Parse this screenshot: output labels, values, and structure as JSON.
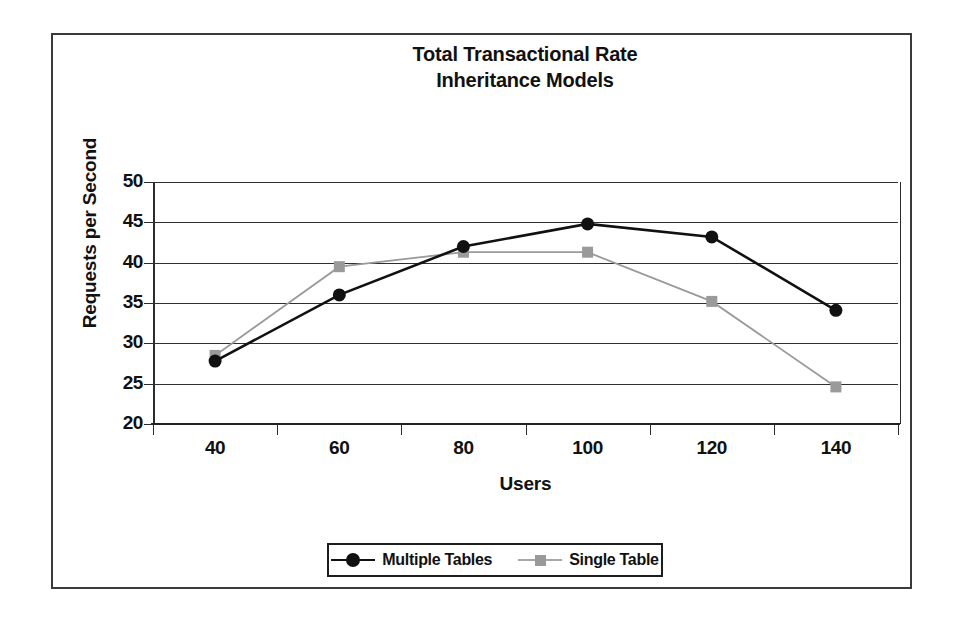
{
  "chart_data": {
    "type": "line",
    "title": "Total Transactional Rate\nInheritance Models",
    "title_line1": "Total Transactional Rate",
    "title_line2": "Inheritance Models",
    "xlabel": "Users",
    "ylabel": "Requests per Second",
    "categories": [
      "40",
      "60",
      "80",
      "100",
      "120",
      "140"
    ],
    "x": [
      40,
      60,
      80,
      100,
      120,
      140
    ],
    "ylim": [
      20,
      50
    ],
    "yticks": [
      "50",
      "45",
      "40",
      "35",
      "30",
      "25",
      "20"
    ],
    "ytick_values": [
      50,
      45,
      40,
      35,
      30,
      25,
      20
    ],
    "grid": "horizontal",
    "legend_position": "bottom-center",
    "series": [
      {
        "name": "Multiple Tables",
        "values": [
          27.8,
          36.0,
          42.0,
          44.8,
          43.2,
          34.1
        ],
        "color": "#111111",
        "marker": "circle"
      },
      {
        "name": "Single Table",
        "values": [
          28.5,
          39.5,
          41.3,
          41.3,
          35.2,
          24.6
        ],
        "color": "#9a9a9a",
        "marker": "square"
      }
    ]
  },
  "legend": {
    "entries": [
      {
        "label": "Multiple Tables",
        "marker": "circle-marker-icon"
      },
      {
        "label": "Single Table",
        "marker": "square-marker-icon"
      }
    ]
  },
  "colors": {
    "series_multiple_tables": "#111111",
    "series_single_table": "#9a9a9a",
    "axis": "#2b2b2b",
    "gridline": "#2f2f2f",
    "frame": "#3a3a3a",
    "background": "#ffffff"
  }
}
